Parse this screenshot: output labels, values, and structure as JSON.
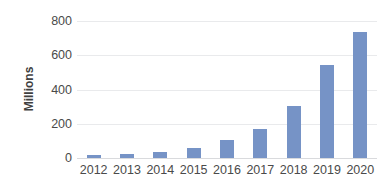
{
  "chart_data": {
    "type": "bar",
    "title": "",
    "subtitle": "",
    "xlabel": "",
    "ylabel": "Millions",
    "categories": [
      "2012",
      "2013",
      "2014",
      "2015",
      "2016",
      "2017",
      "2018",
      "2019",
      "2020"
    ],
    "values": [
      17,
      22,
      33,
      58,
      105,
      170,
      305,
      545,
      735
    ],
    "series": [
      {
        "name": "",
        "values": [
          17,
          22,
          33,
          58,
          105,
          170,
          305,
          545,
          735
        ]
      }
    ],
    "ylim": [
      0,
      800
    ],
    "y_ticks": [
      0,
      200,
      400,
      600,
      800
    ],
    "y_tick_labels": [
      "0",
      "200",
      "400",
      "600",
      "800"
    ],
    "x_tick_labels": [
      "2012",
      "2013",
      "2014",
      "2015",
      "2016",
      "2017",
      "2018",
      "2019",
      "2020"
    ],
    "grid": true,
    "grid_axis": "y",
    "legend": false,
    "legend_position": "none",
    "bar_color": "#7693c6",
    "gridline_color": "#e9eaec",
    "axis_line_color": "#d9dadd",
    "tick_label_color": "#4a4a4a",
    "axis_title_color": "#3f3f3f",
    "background_color": "#ffffff",
    "annotations": []
  }
}
